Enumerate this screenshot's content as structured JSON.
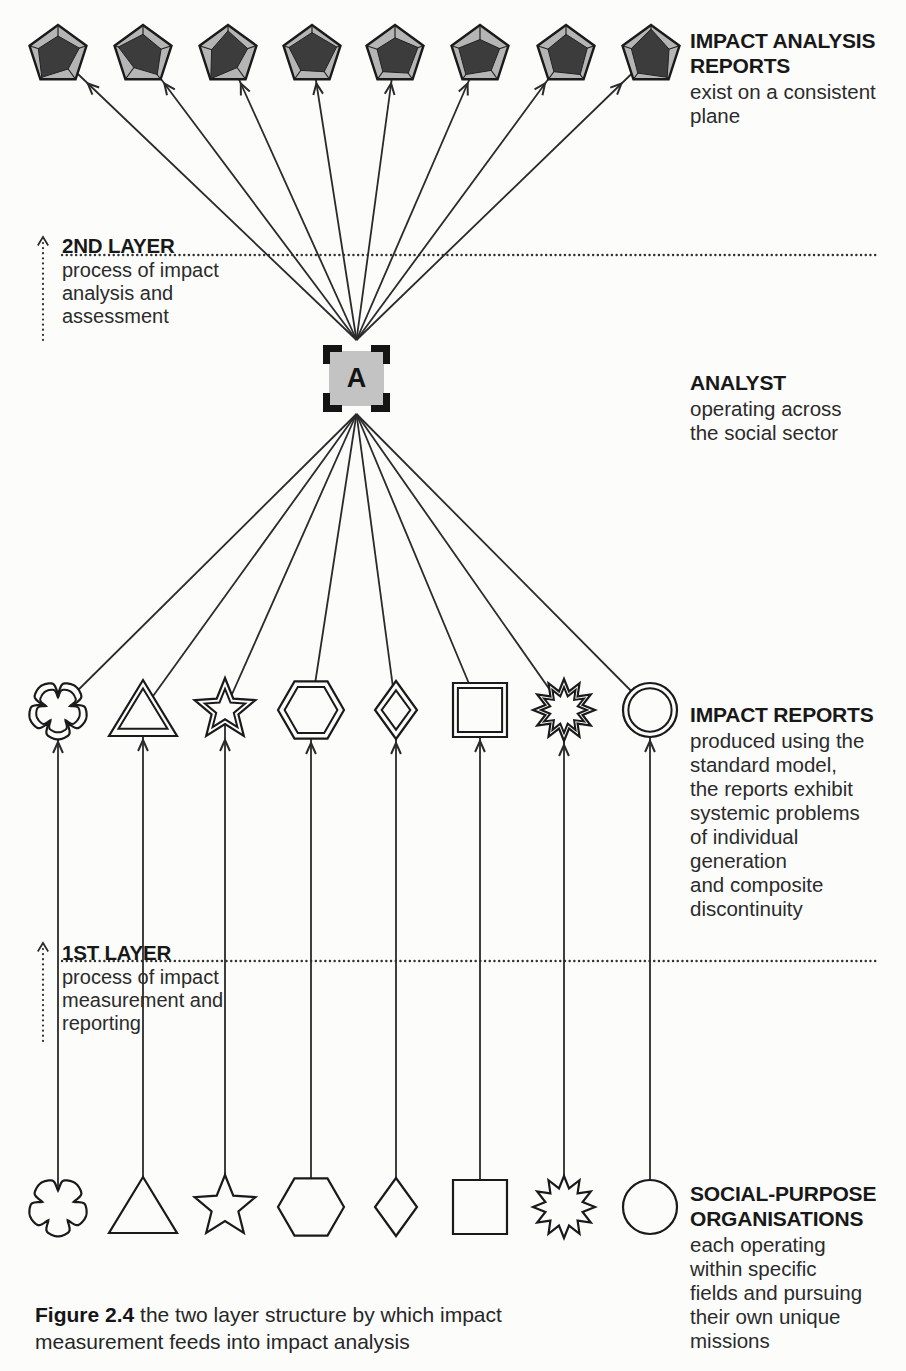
{
  "colors": {
    "ink": "#1f1f1f",
    "line": "#2a2a2a",
    "paper": "#fcfcfb",
    "pentagon_fill": "#b5b5b5",
    "pentagon_inner": "#3c3c3c",
    "analyst_fill": "#c3c3c3",
    "bracket": "#141414"
  },
  "top_row": {
    "label_title": "IMPACT ANALYSIS\nREPORTS",
    "label_desc": "exist on a consistent\nplane",
    "items": [
      {
        "shape": "pentagon-radar",
        "radar": [
          0.55,
          0.65,
          0.5,
          0.8,
          0.6
        ]
      },
      {
        "shape": "pentagon-radar",
        "radar": [
          0.6,
          0.55,
          0.7,
          0.45,
          0.75
        ]
      },
      {
        "shape": "pentagon-radar",
        "radar": [
          0.7,
          0.6,
          0.45,
          0.85,
          0.5
        ]
      },
      {
        "shape": "pentagon-radar",
        "radar": [
          0.65,
          0.75,
          0.6,
          0.55,
          0.7
        ]
      },
      {
        "shape": "pentagon-radar",
        "radar": [
          0.5,
          0.7,
          0.65,
          0.6,
          0.55
        ]
      },
      {
        "shape": "pentagon-radar",
        "radar": [
          0.45,
          0.6,
          0.55,
          0.7,
          0.65
        ]
      },
      {
        "shape": "pentagon-radar",
        "radar": [
          0.6,
          0.65,
          0.7,
          0.6,
          0.55
        ]
      },
      {
        "shape": "pentagon-radar",
        "radar": [
          0.75,
          0.55,
          0.8,
          0.65,
          0.6
        ]
      }
    ]
  },
  "layer2": {
    "title": "2ND LAYER",
    "desc": "process of impact\nanalysis and\nassessment"
  },
  "analyst": {
    "letter": "A",
    "title": "ANALYST",
    "desc": "operating across\nthe social sector"
  },
  "middle_row": {
    "label_title": "IMPACT REPORTS",
    "label_desc": "produced using the\nstandard model,\nthe reports exhibit\nsystemic problems\nof individual\ngeneration\nand composite\ndiscontinuity",
    "items": [
      {
        "shape": "flower"
      },
      {
        "shape": "triangle"
      },
      {
        "shape": "star"
      },
      {
        "shape": "hexagon"
      },
      {
        "shape": "diamond"
      },
      {
        "shape": "square"
      },
      {
        "shape": "burst"
      },
      {
        "shape": "circle"
      }
    ]
  },
  "layer1": {
    "title": "1ST LAYER",
    "desc": "process of impact\nmeasurement and\nreporting"
  },
  "bottom_row": {
    "label_title": "SOCIAL-PURPOSE\nORGANISATIONS",
    "label_desc": "each operating\nwithin specific\nfields and pursuing\ntheir own unique\nmissions",
    "items": [
      {
        "shape": "flower"
      },
      {
        "shape": "triangle"
      },
      {
        "shape": "star"
      },
      {
        "shape": "hexagon"
      },
      {
        "shape": "diamond"
      },
      {
        "shape": "square"
      },
      {
        "shape": "burst"
      },
      {
        "shape": "circle"
      }
    ]
  },
  "caption": {
    "figure": "Figure 2.4",
    "line1": "the two layer structure by which impact",
    "line2": "measurement feeds into impact analysis"
  }
}
